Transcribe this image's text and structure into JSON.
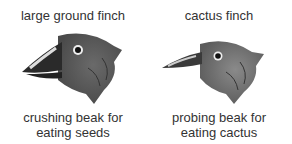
{
  "finches": [
    {
      "name": "large ground finch",
      "caption_line1": "crushing beak for",
      "caption_line2": "eating seeds"
    },
    {
      "name": "cactus finch",
      "caption_line1": "probing beak for",
      "caption_line2": "eating cactus"
    }
  ],
  "colors": {
    "head": "#5a5a5a",
    "beak": "#2a2a2a",
    "text": "#333333"
  }
}
